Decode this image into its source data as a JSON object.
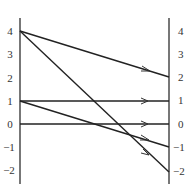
{
  "diagram": {
    "type": "mapping-diagram",
    "left_axis": {
      "ticks": [
        "4",
        "3",
        "2",
        "1",
        "0",
        "−1",
        "−2"
      ],
      "values": [
        4,
        3,
        2,
        1,
        0,
        -1,
        -2
      ]
    },
    "right_axis": {
      "ticks": [
        "2",
        "1",
        "0",
        "−1",
        "−2"
      ],
      "top_ticks": [
        "4",
        "3"
      ],
      "values": [
        4,
        3,
        2,
        1,
        0,
        -1,
        -2
      ]
    },
    "mappings": [
      {
        "from": 4,
        "to": 2
      },
      {
        "from": 4,
        "to": -2
      },
      {
        "from": 1,
        "to": 1
      },
      {
        "from": 1,
        "to": -1
      },
      {
        "from": 0,
        "to": 0
      }
    ],
    "line_color": "#222222",
    "axis_color": "#444444"
  }
}
